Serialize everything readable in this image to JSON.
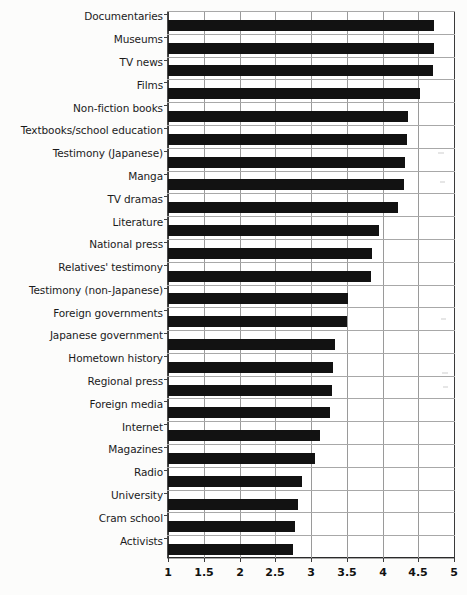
{
  "chart_data": {
    "type": "bar",
    "orientation": "horizontal",
    "title": "",
    "subtitle": "",
    "xlabel": "",
    "ylabel": "",
    "xlim": [
      1,
      5
    ],
    "ylim": null,
    "grid": true,
    "legend": null,
    "legend_position": "none",
    "xticks": [
      "1",
      "1.5",
      "2",
      "2.5",
      "3",
      "3.5",
      "4",
      "4.5",
      "5"
    ],
    "xtick_values": [
      1,
      1.5,
      2,
      2.5,
      3,
      3.5,
      4,
      4.5,
      5
    ],
    "bar_color": "#121212",
    "categories": [
      "Documentaries",
      "Museums",
      "TV news",
      "Films",
      "Non-fiction books",
      "Textbooks/school education",
      "Testimony (Japanese)",
      "Manga",
      "TV dramas",
      "Literature",
      "National press",
      "Relatives' testimony",
      "Testimony (non-Japanese)",
      "Foreign governments",
      "Japanese government",
      "Hometown history",
      "Regional press",
      "Foreign media",
      "Internet",
      "Magazines",
      "Radio",
      "University",
      "Cram school",
      "Activists"
    ],
    "values": [
      4.72,
      4.72,
      4.71,
      4.53,
      4.36,
      4.34,
      4.31,
      4.3,
      4.22,
      3.95,
      3.85,
      3.84,
      3.52,
      3.51,
      3.33,
      3.31,
      3.29,
      3.27,
      3.12,
      3.05,
      2.87,
      2.82,
      2.78,
      2.75
    ]
  }
}
